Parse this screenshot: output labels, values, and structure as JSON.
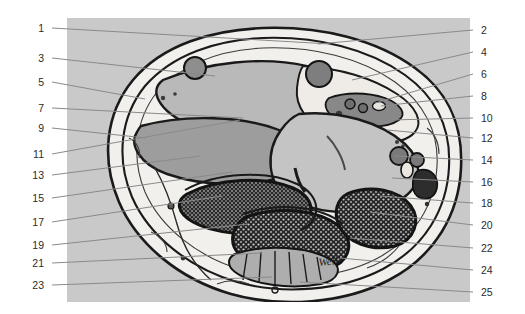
{
  "figure": {
    "kind": "anatomical-cross-section",
    "signature_text": "Welle",
    "panel": {
      "x": 67,
      "y": 18,
      "width": 403,
      "height": 284,
      "background": "#c9c9c9"
    },
    "canvas": {
      "width": 525,
      "height": 314,
      "background": "#ffffff"
    },
    "palette": {
      "page_background": "#ffffff",
      "panel_background": "#c9c9c9",
      "leader_line": "#8a8a8a",
      "label_text": "#2b2b2b",
      "outline_dark": "#1a1a1a",
      "tissue_light": "#f2f0ec",
      "tissue_mid": "#b9b9b9",
      "tissue_grey": "#9d9d9d",
      "vessel_dark": "#6e6e6e",
      "bone_marrow": "#2a2a2a"
    }
  },
  "labels_left": [
    {
      "number": "1",
      "text_x": 44,
      "text_y": 28,
      "line_x1": 52,
      "line_y1": 28,
      "line_x2": 330,
      "line_y2": 44
    },
    {
      "number": "3",
      "text_x": 44,
      "text_y": 58,
      "line_x1": 52,
      "line_y1": 58,
      "line_x2": 215,
      "line_y2": 76
    },
    {
      "number": "5",
      "text_x": 44,
      "text_y": 82,
      "line_x1": 52,
      "line_y1": 82,
      "line_x2": 145,
      "line_y2": 99
    },
    {
      "number": "7",
      "text_x": 44,
      "text_y": 108,
      "line_x1": 52,
      "line_y1": 108,
      "line_x2": 243,
      "line_y2": 118
    },
    {
      "number": "9",
      "text_x": 44,
      "text_y": 128,
      "line_x1": 52,
      "line_y1": 128,
      "line_x2": 146,
      "line_y2": 138
    },
    {
      "number": "11",
      "text_x": 44,
      "text_y": 154,
      "line_x1": 52,
      "line_y1": 154,
      "line_x2": 240,
      "line_y2": 120
    },
    {
      "number": "13",
      "text_x": 44,
      "text_y": 175,
      "line_x1": 52,
      "line_y1": 175,
      "line_x2": 200,
      "line_y2": 156
    },
    {
      "number": "15",
      "text_x": 44,
      "text_y": 198,
      "line_x1": 52,
      "line_y1": 198,
      "line_x2": 232,
      "line_y2": 172
    },
    {
      "number": "17",
      "text_x": 44,
      "text_y": 222,
      "line_x1": 52,
      "line_y1": 222,
      "line_x2": 222,
      "line_y2": 196
    },
    {
      "number": "19",
      "text_x": 44,
      "text_y": 245,
      "line_x1": 52,
      "line_y1": 245,
      "line_x2": 248,
      "line_y2": 224
    },
    {
      "number": "21",
      "text_x": 44,
      "text_y": 263,
      "line_x1": 52,
      "line_y1": 263,
      "line_x2": 262,
      "line_y2": 253
    },
    {
      "number": "23",
      "text_x": 44,
      "text_y": 285,
      "line_x1": 52,
      "line_y1": 285,
      "line_x2": 272,
      "line_y2": 277
    }
  ],
  "labels_right": [
    {
      "number": "2",
      "text_x": 481,
      "text_y": 30,
      "line_x1": 473,
      "line_y1": 30,
      "line_x2": 318,
      "line_y2": 44
    },
    {
      "number": "4",
      "text_x": 481,
      "text_y": 52,
      "line_x1": 473,
      "line_y1": 52,
      "line_x2": 352,
      "line_y2": 80
    },
    {
      "number": "6",
      "text_x": 481,
      "text_y": 74,
      "line_x1": 473,
      "line_y1": 74,
      "line_x2": 375,
      "line_y2": 103
    },
    {
      "number": "8",
      "text_x": 481,
      "text_y": 96,
      "line_x1": 473,
      "line_y1": 96,
      "line_x2": 381,
      "line_y2": 106
    },
    {
      "number": "10",
      "text_x": 481,
      "text_y": 118,
      "line_x1": 473,
      "line_y1": 118,
      "line_x2": 390,
      "line_y2": 120
    },
    {
      "number": "12",
      "text_x": 481,
      "text_y": 138,
      "line_x1": 473,
      "line_y1": 138,
      "line_x2": 387,
      "line_y2": 130
    },
    {
      "number": "14",
      "text_x": 481,
      "text_y": 160,
      "line_x1": 473,
      "line_y1": 160,
      "line_x2": 394,
      "line_y2": 156
    },
    {
      "number": "16",
      "text_x": 481,
      "text_y": 182,
      "line_x1": 473,
      "line_y1": 182,
      "line_x2": 392,
      "line_y2": 178
    },
    {
      "number": "18",
      "text_x": 481,
      "text_y": 203,
      "line_x1": 473,
      "line_y1": 203,
      "line_x2": 380,
      "line_y2": 196
    },
    {
      "number": "20",
      "text_x": 481,
      "text_y": 225,
      "line_x1": 473,
      "line_y1": 225,
      "line_x2": 370,
      "line_y2": 212
    },
    {
      "number": "22",
      "text_x": 481,
      "text_y": 248,
      "line_x1": 473,
      "line_y1": 248,
      "line_x2": 350,
      "line_y2": 238
    },
    {
      "number": "24",
      "text_x": 481,
      "text_y": 270,
      "line_x1": 473,
      "line_y1": 270,
      "line_x2": 340,
      "line_y2": 258
    },
    {
      "number": "25",
      "text_x": 481,
      "text_y": 292,
      "line_x1": 473,
      "line_y1": 292,
      "line_x2": 300,
      "line_y2": 282
    }
  ]
}
